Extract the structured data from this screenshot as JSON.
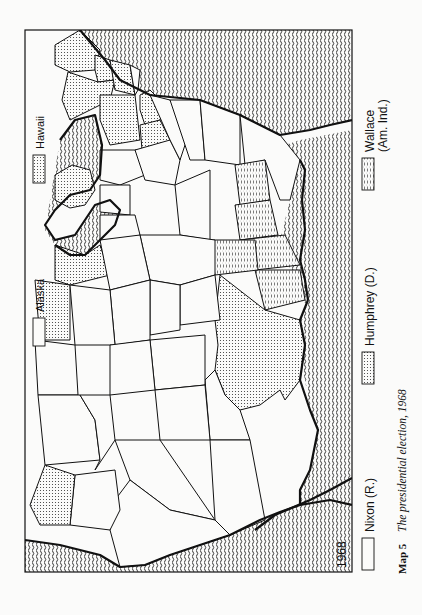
{
  "map": {
    "year_label": "1968",
    "inset_legend": [
      {
        "label": "Alaska",
        "winner": "nixon"
      },
      {
        "label": "Hawaii",
        "winner": "humphrey"
      }
    ],
    "legend": [
      {
        "key": "nixon",
        "label": "Nixon (R.)",
        "pattern": "blank"
      },
      {
        "key": "humphrey",
        "label": "Humphrey (D.)",
        "pattern": "fine-dots"
      },
      {
        "key": "wallace",
        "label_line1": "Wallace",
        "label_line2": "(Am. Ind.)",
        "pattern": "vertical-dashes"
      }
    ],
    "caption": {
      "number": "Map 5",
      "title": "The presidential election, 1968"
    },
    "orientation": "rotated 90° counter-clockwise",
    "colors": {
      "ink": "#111111",
      "paper": "#fbfbfa"
    }
  }
}
